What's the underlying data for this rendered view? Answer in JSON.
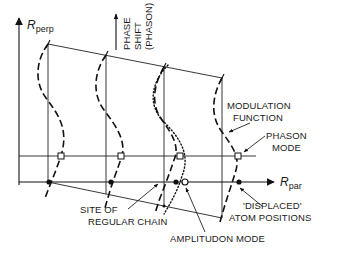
{
  "figure": {
    "axes": {
      "vertical": {
        "symbol": "R",
        "subscript": "perp"
      },
      "horizontal": {
        "symbol": "R",
        "subscript": "par"
      }
    },
    "phase_shift_label": [
      "PHASE",
      "SHIFT",
      "(PHASON)"
    ],
    "annotations": {
      "modulation_function": [
        "MODULATION",
        "FUNCTION"
      ],
      "phason_mode": [
        "PHASON",
        "MODE"
      ],
      "displaced_atoms": [
        "'DISPLACED'",
        "ATOM POSITIONS"
      ],
      "site_of_regular_chain": [
        "SITE OF",
        "REGULAR CHAIN"
      ],
      "amplitudon_mode": "AMPLITUDON MODE"
    },
    "legend_styles": {
      "modulation_curve": "dashed",
      "amplitudon_curve": "dotted",
      "regular_site_marker": "filled-dot",
      "displaced_marker": "open-square"
    }
  }
}
